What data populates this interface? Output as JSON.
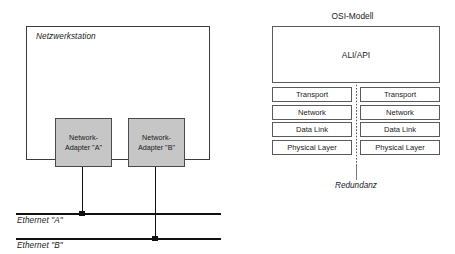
{
  "left_diagram": {
    "station_label": "Netzwerkstation",
    "adapters": [
      {
        "line1": "Network-",
        "line2": "Adapter \"A\""
      },
      {
        "line1": "Network-",
        "line2": "Adapter \"B\""
      }
    ],
    "buses": [
      {
        "label": "Ethernet \"A\""
      },
      {
        "label": "Ethernet \"B\""
      }
    ]
  },
  "osi_diagram": {
    "title": "OSI-Modell",
    "top_box_label": "ALI/API",
    "rows": [
      {
        "left": "Transport",
        "right": "Transport"
      },
      {
        "left": "Network",
        "right": "Network"
      },
      {
        "left": "Data Link",
        "right": "Data Link"
      },
      {
        "left": "Physical Layer",
        "right": "Physical Layer"
      }
    ],
    "redundancy_label": "Redundanz"
  },
  "colors": {
    "adapter_fill": "#c6c6c6",
    "line": "#111111",
    "box_border": "#5a5a5a",
    "background": "#ffffff"
  }
}
